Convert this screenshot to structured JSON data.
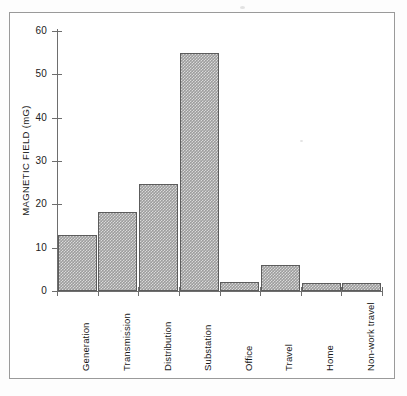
{
  "figure": {
    "frame_color": "#9a9a9a",
    "background": "#ffffff"
  },
  "chart_data": {
    "type": "bar",
    "title": "",
    "xlabel": "",
    "ylabel": "MAGNETIC FIELD (mG)",
    "categories": [
      "Generation",
      "Transmission",
      "Distribution",
      "Substation",
      "Office",
      "Travel",
      "Home",
      "Non-work travel"
    ],
    "values": [
      13.0,
      18.2,
      24.7,
      55.0,
      2.0,
      6.0,
      1.8,
      1.8
    ],
    "ylim": [
      0,
      60
    ],
    "yticks": [
      0,
      10,
      20,
      30,
      40,
      50,
      60
    ],
    "ytick_labels": [
      "0",
      "10",
      "20",
      "30",
      "40",
      "50",
      "60"
    ],
    "grid": false,
    "legend": null,
    "bar_fill_color": "#9d9d9d",
    "bar_edge_color": "#5c5c5c",
    "axis_color": "#6e6e6e"
  }
}
